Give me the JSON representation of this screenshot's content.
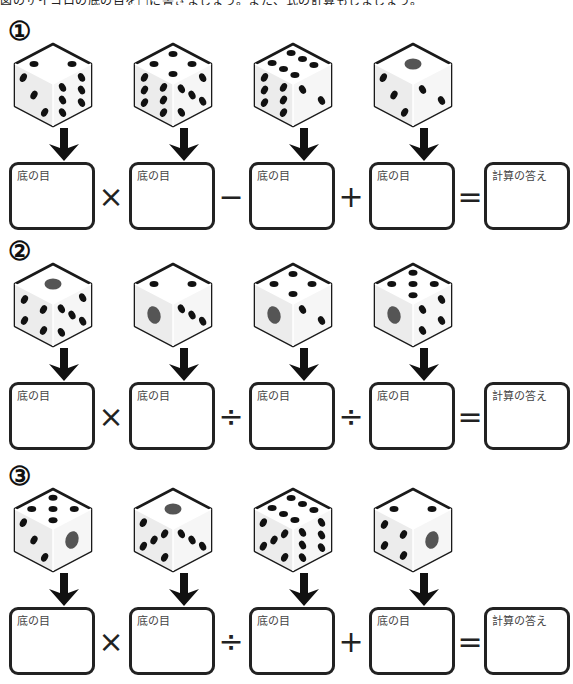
{
  "instruction": "図のサイコロの底の目を□に書きましょう。また、式の計算もしましょう。",
  "box_label_bottom": "底の目",
  "box_label_answer": "計算の答え",
  "problems": [
    {
      "label": "①",
      "dice": [
        {
          "top": 2,
          "left": 3,
          "right": 6
        },
        {
          "top": 4,
          "left": 6,
          "right": 5
        },
        {
          "top": 6,
          "left": 6,
          "right": 2
        },
        {
          "top": 1,
          "left": 3,
          "right": 2
        }
      ],
      "operators": [
        "×",
        "−",
        "+",
        "="
      ]
    },
    {
      "label": "②",
      "dice": [
        {
          "top": 1,
          "left": 4,
          "right": 5
        },
        {
          "top": 2,
          "left": 1,
          "right": 3
        },
        {
          "top": 4,
          "left": 1,
          "right": 2
        },
        {
          "top": 5,
          "left": 1,
          "right": 4
        }
      ],
      "operators": [
        "×",
        "÷",
        "÷",
        "="
      ]
    },
    {
      "label": "③",
      "dice": [
        {
          "top": 5,
          "left": 3,
          "right": 1
        },
        {
          "top": 1,
          "left": 5,
          "right": 3
        },
        {
          "top": 6,
          "left": 5,
          "right": 6
        },
        {
          "top": 2,
          "left": 4,
          "right": 1
        }
      ],
      "operators": [
        "×",
        "÷",
        "+",
        "="
      ]
    }
  ],
  "colors": {
    "pip": "#111111",
    "one_pip": "#555555",
    "outline": "#1a1a1a"
  }
}
